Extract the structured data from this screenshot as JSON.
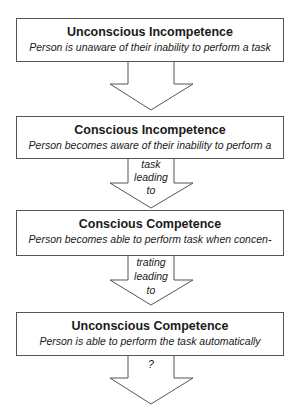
{
  "diagram": {
    "type": "flowchart",
    "stages": [
      {
        "title": "Unconscious Incompetence",
        "description": "Person is unaware of their inability to perform a task",
        "arrow_text": []
      },
      {
        "title": "Conscious Incompetence",
        "description": "Person becomes aware of their inability to perform a",
        "arrow_text": [
          "task",
          "leading",
          "to"
        ]
      },
      {
        "title": "Conscious Competence",
        "description": "Person becomes able to perform task when concen-",
        "arrow_text": [
          "trating",
          "leading",
          "to"
        ]
      },
      {
        "title": "Unconscious Competence",
        "description": "Person is able to perform the task automatically",
        "arrow_text": [
          "?"
        ]
      }
    ],
    "colors": {
      "stroke": "#555555",
      "fill": "#ffffff",
      "text": "#1a1a1a"
    }
  }
}
